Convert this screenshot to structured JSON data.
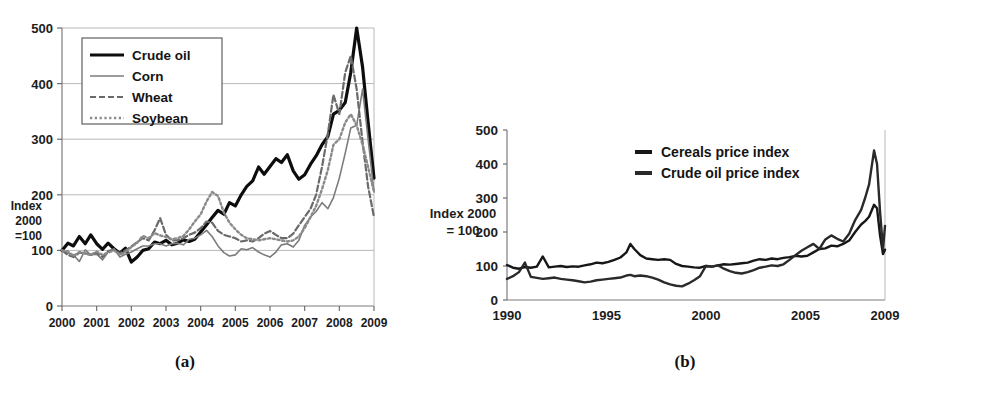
{
  "figure": {
    "caption_a": "(a)",
    "caption_b": "(b)"
  },
  "chart_data": [
    {
      "id": "panel-a",
      "type": "line",
      "title": "",
      "xlabel": "",
      "ylabel": "Index 2000 =100",
      "ylabel_lines": [
        "Index",
        "2000",
        "=100"
      ],
      "xlim": [
        2000,
        2009
      ],
      "ylim": [
        0,
        500
      ],
      "yticks": [
        0,
        100,
        200,
        300,
        400,
        500
      ],
      "xticks": [
        2000,
        2001,
        2002,
        2003,
        2004,
        2005,
        2006,
        2007,
        2008,
        2009
      ],
      "grid": true,
      "legend_position": "top-left",
      "legend": [
        "Crude oil",
        "Corn",
        "Wheat",
        "Soybean"
      ],
      "x": [
        2000.0,
        2000.17,
        2000.33,
        2000.5,
        2000.67,
        2000.83,
        2001.0,
        2001.17,
        2001.33,
        2001.5,
        2001.67,
        2001.83,
        2002.0,
        2002.17,
        2002.33,
        2002.5,
        2002.67,
        2002.83,
        2003.0,
        2003.17,
        2003.33,
        2003.5,
        2003.67,
        2003.83,
        2004.0,
        2004.17,
        2004.33,
        2004.5,
        2004.67,
        2004.83,
        2005.0,
        2005.17,
        2005.33,
        2005.5,
        2005.67,
        2005.83,
        2006.0,
        2006.17,
        2006.33,
        2006.5,
        2006.67,
        2006.83,
        2007.0,
        2007.17,
        2007.33,
        2007.5,
        2007.67,
        2007.83,
        2008.0,
        2008.17,
        2008.33,
        2008.5,
        2008.67,
        2008.83,
        2009.0
      ],
      "series": [
        {
          "name": "Crude oil",
          "style": "solid-thick",
          "color": "#0d0d0d",
          "width": 3.2,
          "values": [
            100,
            113,
            108,
            125,
            112,
            128,
            112,
            102,
            113,
            103,
            95,
            104,
            79,
            88,
            100,
            103,
            115,
            112,
            118,
            110,
            113,
            119,
            116,
            120,
            133,
            146,
            159,
            172,
            165,
            186,
            180,
            200,
            215,
            225,
            250,
            237,
            251,
            265,
            258,
            272,
            243,
            228,
            236,
            255,
            270,
            290,
            305,
            345,
            352,
            366,
            420,
            500,
            430,
            330,
            230
          ]
        },
        {
          "name": "Corn",
          "style": "solid-thin",
          "color": "#7c7c7c",
          "width": 1.6,
          "values": [
            100,
            95,
            92,
            80,
            101,
            92,
            93,
            83,
            97,
            103,
            88,
            93,
            97,
            103,
            108,
            108,
            112,
            112,
            108,
            112,
            113,
            110,
            120,
            122,
            128,
            136,
            125,
            108,
            96,
            90,
            92,
            103,
            101,
            105,
            97,
            92,
            88,
            97,
            110,
            112,
            106,
            118,
            145,
            160,
            170,
            186,
            175,
            195,
            230,
            275,
            320,
            325,
            390,
            300,
            205
          ]
        },
        {
          "name": "Wheat",
          "style": "dashed",
          "color": "#6a6a6a",
          "width": 2.2,
          "values": [
            100,
            92,
            88,
            96,
            95,
            92,
            96,
            88,
            99,
            101,
            95,
            100,
            107,
            115,
            122,
            118,
            136,
            158,
            128,
            118,
            118,
            122,
            128,
            132,
            140,
            152,
            150,
            135,
            128,
            125,
            122,
            116,
            118,
            116,
            122,
            130,
            135,
            128,
            122,
            122,
            130,
            145,
            160,
            175,
            200,
            250,
            310,
            380,
            345,
            420,
            450,
            390,
            295,
            215,
            160
          ]
        },
        {
          "name": "Soybean",
          "style": "dotted",
          "color": "#8a8a8a",
          "width": 2.4,
          "values": [
            100,
            98,
            90,
            97,
            94,
            92,
            98,
            92,
            96,
            100,
            92,
            97,
            106,
            114,
            126,
            122,
            131,
            127,
            124,
            120,
            122,
            126,
            138,
            152,
            165,
            188,
            205,
            198,
            168,
            150,
            138,
            128,
            122,
            120,
            118,
            120,
            122,
            120,
            118,
            116,
            118,
            125,
            140,
            160,
            180,
            210,
            245,
            290,
            300,
            330,
            345,
            325,
            290,
            250,
            205
          ]
        }
      ]
    },
    {
      "id": "panel-b",
      "type": "line",
      "title": "",
      "xlabel": "",
      "ylabel": "Index 2000 = 100",
      "ylabel_lines": [
        "Index 2000",
        "= 100"
      ],
      "xlim": [
        1990,
        2009
      ],
      "ylim": [
        0,
        500
      ],
      "yticks": [
        0,
        100,
        200,
        300,
        400,
        500
      ],
      "xticks": [
        1990,
        1995,
        2000,
        2005,
        2009
      ],
      "grid": false,
      "legend_position": "inside-top-right",
      "legend": [
        "Cereals price index",
        "Crude oil price index"
      ],
      "x": [
        1990.0,
        1990.3,
        1990.6,
        1990.9,
        1991.2,
        1991.5,
        1991.8,
        1992.1,
        1992.4,
        1992.7,
        1993.0,
        1993.3,
        1993.6,
        1993.9,
        1994.2,
        1994.5,
        1994.8,
        1995.1,
        1995.4,
        1995.7,
        1996.0,
        1996.2,
        1996.4,
        1996.7,
        1997.0,
        1997.3,
        1997.6,
        1997.9,
        1998.2,
        1998.5,
        1998.8,
        1999.1,
        1999.4,
        1999.7,
        2000.0,
        2000.3,
        2000.6,
        2000.9,
        2001.2,
        2001.5,
        2001.8,
        2002.1,
        2002.4,
        2002.7,
        2003.0,
        2003.3,
        2003.6,
        2003.9,
        2004.2,
        2004.5,
        2004.8,
        2005.1,
        2005.4,
        2005.7,
        2006.0,
        2006.3,
        2006.6,
        2006.9,
        2007.2,
        2007.5,
        2007.8,
        2008.0,
        2008.2,
        2008.45,
        2008.6,
        2008.75,
        2008.9,
        2009.0
      ],
      "series": [
        {
          "name": "Cereals price index",
          "style": "solid",
          "color": "#171717",
          "width": 2.4,
          "values": [
            103,
            95,
            92,
            97,
            95,
            98,
            128,
            96,
            98,
            100,
            97,
            99,
            98,
            102,
            105,
            110,
            108,
            112,
            118,
            125,
            140,
            165,
            150,
            132,
            122,
            120,
            118,
            120,
            118,
            106,
            100,
            98,
            96,
            95,
            100,
            98,
            102,
            105,
            104,
            106,
            108,
            110,
            116,
            120,
            118,
            122,
            120,
            124,
            126,
            130,
            128,
            130,
            140,
            150,
            152,
            160,
            158,
            165,
            175,
            200,
            222,
            232,
            245,
            280,
            270,
            190,
            135,
            148
          ]
        },
        {
          "name": "Crude oil price index",
          "style": "solid",
          "color": "#2a2a2a",
          "width": 2.4,
          "values": [
            62,
            70,
            82,
            110,
            68,
            65,
            62,
            64,
            66,
            62,
            60,
            58,
            55,
            52,
            54,
            58,
            60,
            62,
            64,
            66,
            72,
            74,
            70,
            72,
            70,
            66,
            60,
            52,
            46,
            42,
            40,
            48,
            58,
            70,
            100,
            98,
            102,
            92,
            85,
            80,
            78,
            82,
            88,
            95,
            98,
            102,
            100,
            105,
            118,
            132,
            145,
            155,
            165,
            150,
            178,
            190,
            180,
            172,
            195,
            235,
            265,
            300,
            340,
            440,
            400,
            260,
            150,
            218
          ]
        }
      ]
    }
  ]
}
